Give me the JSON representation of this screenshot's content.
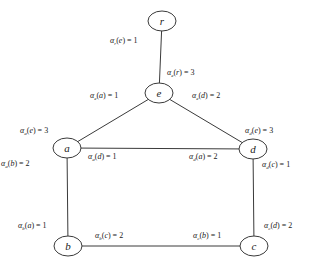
{
  "diagram": {
    "type": "weighted-graph",
    "symbol": "α",
    "nodes": [
      {
        "id": "r",
        "label": "r",
        "x": 162,
        "y": 21
      },
      {
        "id": "e",
        "label": "e",
        "x": 159,
        "y": 93
      },
      {
        "id": "a",
        "label": "a",
        "x": 67,
        "y": 148
      },
      {
        "id": "d",
        "label": "d",
        "x": 253,
        "y": 149
      },
      {
        "id": "b",
        "label": "b",
        "x": 68,
        "y": 246
      },
      {
        "id": "c",
        "label": "c",
        "x": 254,
        "y": 246
      }
    ],
    "edges": [
      {
        "from": "r",
        "to": "e"
      },
      {
        "from": "e",
        "to": "a"
      },
      {
        "from": "e",
        "to": "d"
      },
      {
        "from": "a",
        "to": "d"
      },
      {
        "from": "a",
        "to": "b"
      },
      {
        "from": "d",
        "to": "c"
      },
      {
        "from": "b",
        "to": "c"
      }
    ],
    "labels": [
      {
        "sub": "r",
        "arg": "e",
        "value": "1",
        "x": 110,
        "y": 43,
        "text": "αr(e) = 1"
      },
      {
        "sub": "e",
        "arg": "r",
        "value": "3",
        "x": 167,
        "y": 75,
        "text": "αe(r) = 3"
      },
      {
        "sub": "e",
        "arg": "a",
        "value": "1",
        "x": 90,
        "y": 98,
        "text": "αe(a) = 1"
      },
      {
        "sub": "e",
        "arg": "d",
        "value": "2",
        "x": 192,
        "y": 98,
        "text": "αe(d) = 2"
      },
      {
        "sub": "a",
        "arg": "e",
        "value": "3",
        "x": 20,
        "y": 133,
        "text": "αa(e) = 3"
      },
      {
        "sub": "d",
        "arg": "e",
        "value": "3",
        "x": 245,
        "y": 133,
        "text": "αd(e) = 3"
      },
      {
        "sub": "a",
        "arg": "d",
        "value": "1",
        "x": 88,
        "y": 159,
        "text": "αa(d) = 1"
      },
      {
        "sub": "d",
        "arg": "a",
        "value": "2",
        "x": 189,
        "y": 159,
        "text": "αd(a) = 2"
      },
      {
        "sub": "a",
        "arg": "b",
        "value": "2",
        "x": 1,
        "y": 166,
        "text": "αa(b) = 2"
      },
      {
        "sub": "d",
        "arg": "c",
        "value": "1",
        "x": 262,
        "y": 167,
        "text": "αd(c) = 1"
      },
      {
        "sub": "b",
        "arg": "a",
        "value": "1",
        "x": 18,
        "y": 228,
        "text": "αb(a) = 1"
      },
      {
        "sub": "c",
        "arg": "d",
        "value": "2",
        "x": 264,
        "y": 228,
        "text": "αc(d) = 2"
      },
      {
        "sub": "b",
        "arg": "c",
        "value": "2",
        "x": 95,
        "y": 238,
        "text": "αb(c) = 2"
      },
      {
        "sub": "c",
        "arg": "b",
        "value": "1",
        "x": 193,
        "y": 238,
        "text": "αc(b) = 1"
      }
    ],
    "node_rx": 14,
    "node_ry": 10,
    "colors": {
      "line": "#3a3a3a",
      "text": "#222222",
      "background": "#ffffff"
    }
  }
}
